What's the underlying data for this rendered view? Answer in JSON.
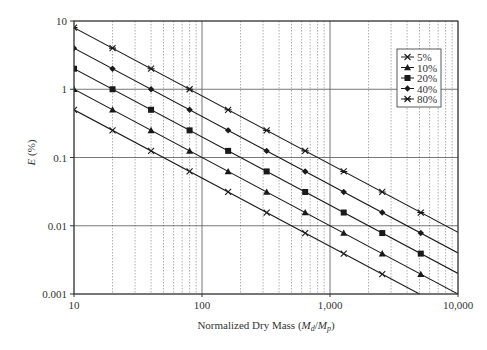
{
  "chart_data": {
    "type": "line",
    "title": "",
    "xlabel": "Normalized Dry Mass",
    "xlabel_symbol": {
      "pre": "(",
      "num": "M",
      "num_sub": "d",
      "slash": "/",
      "den": "M",
      "den_sub": "p",
      "post": ")"
    },
    "ylabel": "E (%)",
    "xscale": "log",
    "yscale": "log",
    "xlim": [
      10,
      10000
    ],
    "ylim": [
      0.001,
      10
    ],
    "x_ticks": [
      10,
      100,
      1000,
      10000
    ],
    "x_tick_labels": [
      "10",
      "100",
      "1,000",
      "10,000"
    ],
    "y_ticks": [
      0.001,
      0.01,
      0.1,
      1,
      10
    ],
    "y_tick_labels": [
      "0.001",
      "0.01",
      "0.1",
      "1",
      "10"
    ],
    "grid": {
      "x_major": "solid",
      "x_minor": "dotted",
      "y_major": "solid",
      "y_minor": "none"
    },
    "legend_position": "upper right",
    "x": [
      10,
      20,
      40,
      80,
      160,
      320,
      640,
      1280,
      2560,
      5120
    ],
    "series": [
      {
        "name": "5%",
        "marker": "x",
        "values": [
          0.5,
          0.25,
          0.125,
          0.0625,
          0.03125,
          0.015625,
          0.0078125,
          0.00390625,
          0.001953125,
          0.0009765625
        ]
      },
      {
        "name": "10%",
        "marker": "triangle",
        "values": [
          1,
          0.5,
          0.25,
          0.125,
          0.0625,
          0.03125,
          0.015625,
          0.0078125,
          0.00390625,
          0.001953125
        ]
      },
      {
        "name": "20%",
        "marker": "square",
        "values": [
          2,
          1,
          0.5,
          0.25,
          0.125,
          0.0625,
          0.03125,
          0.015625,
          0.0078125,
          0.00390625
        ]
      },
      {
        "name": "40%",
        "marker": "diamond",
        "values": [
          4,
          2,
          1,
          0.5,
          0.25,
          0.125,
          0.0625,
          0.03125,
          0.015625,
          0.0078125
        ]
      },
      {
        "name": "80%",
        "marker": "asterisk",
        "values": [
          8,
          4,
          2,
          1,
          0.5,
          0.25,
          0.125,
          0.0625,
          0.03125,
          0.015625
        ]
      }
    ],
    "line_extends_to_x": 10000
  },
  "colors": {
    "line": "#1a1a1a",
    "grid_major": "#555555",
    "grid_minor": "#999999",
    "axis": "#333333"
  }
}
